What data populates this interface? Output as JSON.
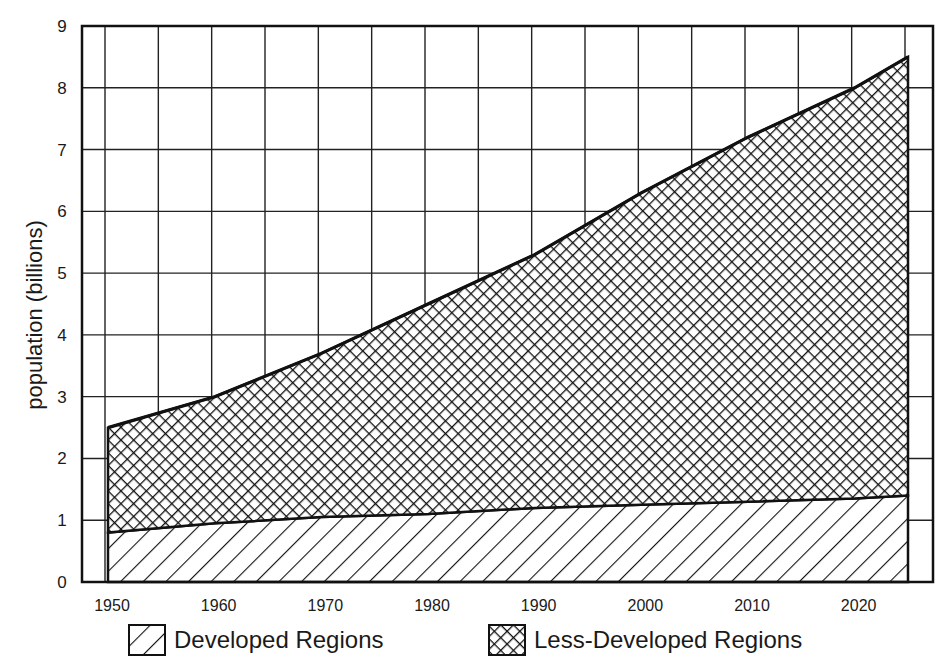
{
  "chart_data": {
    "type": "area",
    "stacked": true,
    "title": "",
    "xlabel": "",
    "ylabel": "population (billions)",
    "x": [
      1950,
      1960,
      1970,
      1980,
      1990,
      2000,
      2010,
      2020,
      2025
    ],
    "series": [
      {
        "name": "Developed Regions",
        "pattern": "diagonal-hatch",
        "values": [
          0.8,
          0.95,
          1.05,
          1.1,
          1.2,
          1.25,
          1.3,
          1.35,
          1.4
        ]
      },
      {
        "name": "Less-Developed Regions",
        "pattern": "cross-hatch",
        "values": [
          1.7,
          2.05,
          2.65,
          3.4,
          4.1,
          5.05,
          5.9,
          6.65,
          7.1
        ]
      }
    ],
    "totals": [
      2.5,
      3.0,
      3.7,
      4.5,
      5.3,
      6.3,
      7.2,
      8.0,
      8.5
    ],
    "xlim": [
      1948,
      2027
    ],
    "ylim": [
      0,
      9
    ],
    "xticks": [
      1950,
      1960,
      1970,
      1980,
      1990,
      2000,
      2010,
      2020
    ],
    "yticks": [
      0,
      1,
      2,
      3,
      4,
      5,
      6,
      7,
      8,
      9
    ],
    "grid": true,
    "grid_x_step": 5,
    "legend_position": "bottom"
  },
  "legend": {
    "developed": "Developed Regions",
    "less_developed": "Less-Developed Regions"
  },
  "axis": {
    "ylabel": "population (billions)"
  },
  "colors": {
    "ink": "#111111",
    "background": "#ffffff"
  }
}
